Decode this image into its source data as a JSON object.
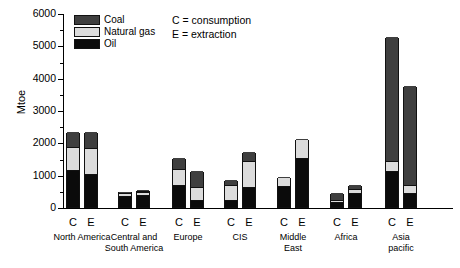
{
  "chart_data": {
    "type": "bar",
    "subtype": "stacked-grouped",
    "title": "",
    "xlabel": "",
    "ylabel": "Mtoe",
    "ylim": [
      0,
      6000
    ],
    "ytick_labels": [
      "0",
      "1000",
      "2000",
      "3000",
      "4000",
      "5000",
      "6000"
    ],
    "ytick_values": [
      0,
      1000,
      2000,
      3000,
      4000,
      5000,
      6000
    ],
    "minor_tick_step": 500,
    "grid": false,
    "legend_position": "top-left-inside",
    "series": [
      {
        "name": "Coal",
        "color": "#3f3f3f"
      },
      {
        "name": "Natural gas",
        "color": "#dcdcdc"
      },
      {
        "name": "Oil",
        "color": "#0b0b0b"
      }
    ],
    "annotations": [
      "C = consumption",
      "E = extraction"
    ],
    "categories": [
      "North America",
      "Central and South America",
      "Europe",
      "CIS",
      "Middle East",
      "Africa",
      "Asia pacific"
    ],
    "bar_types": [
      "C",
      "E"
    ],
    "data": [
      {
        "region": "North America",
        "label_lines": [
          "North America"
        ],
        "bars": [
          {
            "type": "C",
            "oil": 1120,
            "natural_gas": 745,
            "coal": 465,
            "total": 2330
          },
          {
            "type": "E",
            "oil": 1000,
            "natural_gas": 840,
            "coal": 480,
            "total": 2320
          }
        ]
      },
      {
        "region": "Central and South America",
        "label_lines": [
          "Central and",
          "South America"
        ],
        "bars": [
          {
            "type": "C",
            "oil": 310,
            "natural_gas": 130,
            "coal": 40,
            "total": 480
          },
          {
            "type": "E",
            "oil": 340,
            "natural_gas": 140,
            "coal": 45,
            "total": 525
          }
        ]
      },
      {
        "region": "Europe",
        "label_lines": [
          "Europe"
        ],
        "bars": [
          {
            "type": "C",
            "oil": 650,
            "natural_gas": 530,
            "coal": 350,
            "total": 1530
          },
          {
            "type": "E",
            "oil": 200,
            "natural_gas": 420,
            "coal": 500,
            "total": 1120
          }
        ]
      },
      {
        "region": "CIS",
        "label_lines": [
          "CIS"
        ],
        "bars": [
          {
            "type": "C",
            "oil": 190,
            "natural_gas": 480,
            "coal": 160,
            "total": 830
          },
          {
            "type": "E",
            "oil": 580,
            "natural_gas": 855,
            "coal": 265,
            "total": 1700
          }
        ]
      },
      {
        "region": "Middle East",
        "label_lines": [
          "Middle",
          "East"
        ],
        "bars": [
          {
            "type": "C",
            "oil": 630,
            "natural_gas": 290,
            "coal": 10,
            "total": 930
          },
          {
            "type": "E",
            "oil": 1500,
            "natural_gas": 600,
            "coal": 10,
            "total": 2110
          }
        ]
      },
      {
        "region": "Africa",
        "label_lines": [
          "Africa"
        ],
        "bars": [
          {
            "type": "C",
            "oil": 130,
            "natural_gas": 75,
            "coal": 235,
            "total": 440
          },
          {
            "type": "E",
            "oil": 400,
            "natural_gas": 170,
            "coal": 125,
            "total": 695
          }
        ]
      },
      {
        "region": "Asia pacific",
        "label_lines": [
          "Asia",
          "pacific"
        ],
        "bars": [
          {
            "type": "C",
            "oil": 1070,
            "natural_gas": 350,
            "coal": 3830,
            "total": 5250
          },
          {
            "type": "E",
            "oil": 390,
            "natural_gas": 300,
            "coal": 3060,
            "total": 3750
          }
        ]
      }
    ]
  }
}
